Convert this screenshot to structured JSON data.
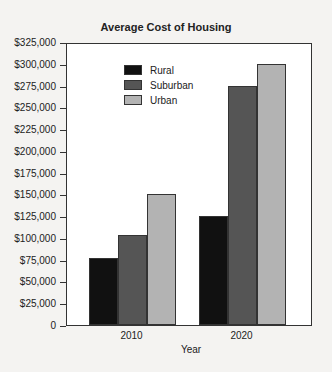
{
  "chart_data": {
    "type": "bar",
    "title": "Average Cost of Housing",
    "xlabel": "Year",
    "ylabel": "",
    "categories": [
      "2010",
      "2020"
    ],
    "series": [
      {
        "name": "Rural",
        "color": "#111111",
        "values": [
          77000,
          125000
        ]
      },
      {
        "name": "Suburban",
        "color": "#555555",
        "values": [
          103000,
          275000
        ]
      },
      {
        "name": "Urban",
        "color": "#b3b3b3",
        "values": [
          150000,
          300000
        ]
      }
    ],
    "ylim": [
      0,
      325000
    ],
    "yticks": [
      "0",
      "$25,000",
      "$50,000",
      "$75,000",
      "$100,000",
      "$125,000",
      "$150,000",
      "$175,000",
      "$200,000",
      "$225,000",
      "$250,000",
      "$275,000",
      "$300,000",
      "$325,000"
    ],
    "grid": false,
    "legend_position": "upper left inside"
  }
}
